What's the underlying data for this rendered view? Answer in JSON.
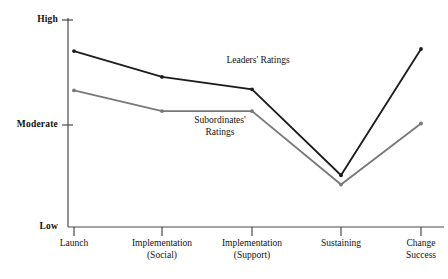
{
  "chart_data": {
    "type": "line",
    "title": "",
    "subtitle": "",
    "xlabel": "",
    "ylabel": "",
    "grid": false,
    "legend_position": "inline-annotation",
    "categories": [
      "Launch",
      "Implementation (Social)",
      "Implementation (Support)",
      "Sustaining",
      "Change Success"
    ],
    "category_lines": [
      [
        "Launch"
      ],
      [
        "Implementation",
        "(Social)"
      ],
      [
        "Implementation",
        "(Support)"
      ],
      [
        "Sustaining"
      ],
      [
        "Change",
        "Success"
      ]
    ],
    "ytick_labels": [
      "High",
      "Moderate",
      "Low"
    ],
    "ytick_values": [
      3,
      2,
      1
    ],
    "ylim": [
      1,
      3
    ],
    "series": [
      {
        "name": "Leaders' Ratings",
        "color": "#1c1c1c",
        "values": [
          2.7,
          2.45,
          2.33,
          1.5,
          2.72
        ]
      },
      {
        "name": "Subordinates' Ratings",
        "color": "#787878",
        "values": [
          2.32,
          2.12,
          2.12,
          1.41,
          2.0
        ]
      }
    ],
    "annotations": [
      {
        "text": "Leaders' Ratings",
        "lines": [
          "Leaders' Ratings"
        ],
        "x": 258,
        "y": 55
      },
      {
        "text": "Subordinates' Ratings",
        "lines": [
          "Subordinates'",
          "Ratings"
        ],
        "x": 220,
        "y": 115
      }
    ]
  },
  "axis": {
    "y_high_label": "High",
    "y_moderate_label": "Moderate",
    "y_low_label": "Low"
  },
  "caption": {
    "text": ""
  }
}
